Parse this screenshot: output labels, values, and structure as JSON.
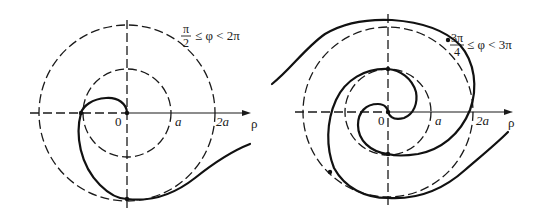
{
  "figure": {
    "colors": {
      "ink": "#111111",
      "background": "#ffffff"
    }
  },
  "left_plot": {
    "range_label": {
      "numerator": "π",
      "denominator": "2",
      "relation": "≤ φ < 2π"
    },
    "axis_labels": {
      "origin": "0",
      "a": "a",
      "two_a": "2a",
      "rho": "ρ"
    },
    "circles": [
      "a",
      "2a"
    ]
  },
  "right_plot": {
    "range_label": {
      "numerator": "3π",
      "denominator": "4",
      "relation": "≤ φ < 3π"
    },
    "axis_labels": {
      "origin": "0",
      "a": "a",
      "two_a": "2a",
      "rho": "ρ"
    },
    "circles": [
      "a",
      "2a"
    ]
  }
}
